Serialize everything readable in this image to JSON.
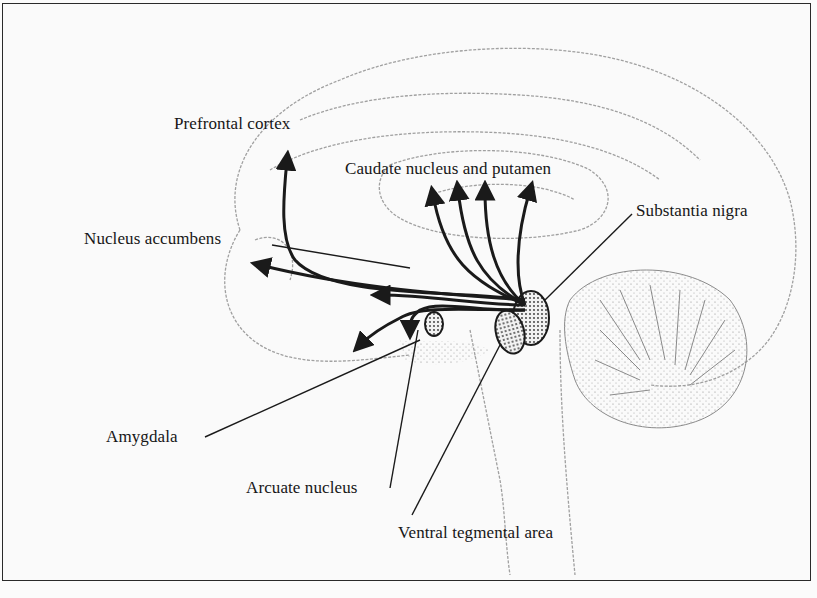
{
  "diagram": {
    "labels": {
      "prefrontal_cortex": "Prefrontal cortex",
      "caudate_putamen": "Caudate nucleus and putamen",
      "substantia_nigra": "Substantia nigra",
      "nucleus_accumbens": "Nucleus accumbens",
      "amygdala": "Amygdala",
      "arcuate_nucleus": "Arcuate nucleus",
      "ventral_tegmental_area": "Ventral tegmental area"
    },
    "colors": {
      "ink": "#1a1a1a",
      "outline": "#9a9a9a",
      "background": "#fafafa"
    }
  }
}
